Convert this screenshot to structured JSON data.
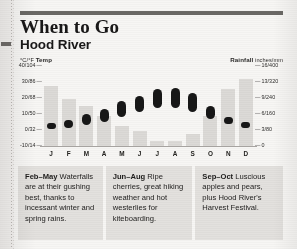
{
  "header": {
    "title": "When to Go",
    "subtitle": "Hood River"
  },
  "axes": {
    "left_caption_unit": "°C/°F",
    "left_caption_label": "Temp",
    "right_caption_label": "Rainfall",
    "right_caption_unit": "inches/mm",
    "left_ticks": [
      "40/104",
      "30/86",
      "20/68",
      "10/50",
      "0/32",
      "-10/14"
    ],
    "right_ticks": [
      "16/400",
      "13/320",
      "9/240",
      "6/160",
      "3/80",
      "0"
    ]
  },
  "notes": [
    {
      "range": "Feb–May",
      "text": " Waterfalls are at their gushing best, thanks to incessant winter and spring rains."
    },
    {
      "range": "Jun–Aug",
      "text": " Ripe cherries, great hiking weather and hot westerlies for kiteboarding."
    },
    {
      "range": "Sep–Oct",
      "text": " Luscious apples and pears, plus Hood River's Harvest Festival."
    }
  ],
  "colors": {
    "rule": "#6b6966",
    "rain_bar": "#dcdad7",
    "temp_bar": "#171717",
    "note_bg": "#e3e1de",
    "paper": "#f7f6f4"
  },
  "chart_data": {
    "type": "bar",
    "categories": [
      "J",
      "F",
      "M",
      "A",
      "M",
      "J",
      "J",
      "A",
      "S",
      "O",
      "N",
      "D"
    ],
    "month_names": [
      "January",
      "February",
      "March",
      "April",
      "May",
      "June",
      "July",
      "August",
      "September",
      "October",
      "November",
      "December"
    ],
    "xlabel": "",
    "grid": false,
    "legend": "none",
    "left_axis": {
      "label": "Temp",
      "unit": "°C/°F",
      "ylim": [
        -10,
        40
      ],
      "ticks": [
        -10,
        0,
        10,
        20,
        30,
        40
      ],
      "tick_labels": [
        "-10/14",
        "0/32",
        "10/50",
        "20/68",
        "30/86",
        "40/104"
      ]
    },
    "right_axis": {
      "label": "Rainfall",
      "unit": "inches/mm",
      "ylim": [
        0,
        16
      ],
      "ticks": [
        0,
        3,
        6,
        9,
        13,
        16
      ],
      "tick_labels": [
        "0",
        "3/80",
        "6/160",
        "9/240",
        "13/320",
        "16/400"
      ]
    },
    "series": [
      {
        "name": "Rainfall",
        "kind": "bar",
        "unit": "inches",
        "axis": "right",
        "values": [
          12.0,
          9.5,
          8.0,
          6.0,
          4.0,
          3.0,
          1.0,
          1.0,
          2.5,
          6.0,
          11.5,
          13.5
        ]
      },
      {
        "name": "Temperature range",
        "kind": "range",
        "unit": "°C",
        "axis": "left",
        "low": [
          0.5,
          1.5,
          3.0,
          5.0,
          8.0,
          11.5,
          14.0,
          14.0,
          11.5,
          7.0,
          3.5,
          1.0
        ],
        "high": [
          4.5,
          6.0,
          10.0,
          13.0,
          18.0,
          21.0,
          25.5,
          26.0,
          23.0,
          15.0,
          8.0,
          5.0
        ]
      }
    ]
  }
}
